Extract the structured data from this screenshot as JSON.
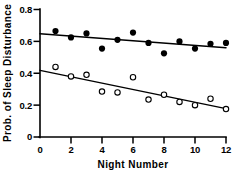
{
  "chart_data": {
    "type": "scatter",
    "title": "",
    "xlabel": "Night Number",
    "ylabel": "Prob. of Sleep Disturbance",
    "xlim": [
      0,
      12
    ],
    "ylim": [
      0,
      0.8
    ],
    "xticks": [
      "0",
      "2",
      "4",
      "6",
      "8",
      "10",
      "12"
    ],
    "xtick_values": [
      0,
      2,
      4,
      6,
      8,
      10,
      12
    ],
    "yticks": [
      "0",
      "0.2",
      "0.4",
      "0.6",
      "0.8"
    ],
    "ytick_values": [
      0,
      0.2,
      0.4,
      0.6,
      0.8
    ],
    "grid": false,
    "legend": "none",
    "series": [
      {
        "name": "filled-circles",
        "marker": "filled circle",
        "color": "#000000",
        "x": [
          1,
          2,
          3,
          4,
          5,
          6,
          7,
          8,
          9,
          10,
          11,
          12
        ],
        "values": [
          0.665,
          0.625,
          0.65,
          0.555,
          0.61,
          0.655,
          0.59,
          0.525,
          0.6,
          0.555,
          0.585,
          0.59
        ],
        "fit_line": {
          "x0": 0,
          "y0": 0.648,
          "x1": 12,
          "y1": 0.56
        }
      },
      {
        "name": "open-circles",
        "marker": "open circle",
        "color": "#000000",
        "x": [
          1,
          2,
          3,
          4,
          5,
          6,
          7,
          8,
          9,
          10,
          11,
          12
        ],
        "values": [
          0.44,
          0.38,
          0.39,
          0.285,
          0.28,
          0.375,
          0.235,
          0.265,
          0.22,
          0.2,
          0.24,
          0.175
        ],
        "fit_line": {
          "x0": 0,
          "y0": 0.418,
          "x1": 12,
          "y1": 0.178
        }
      }
    ]
  },
  "axes": {
    "x_axis_title": "Night Number",
    "y_axis_title": "Prob. of Sleep Disturbance"
  }
}
